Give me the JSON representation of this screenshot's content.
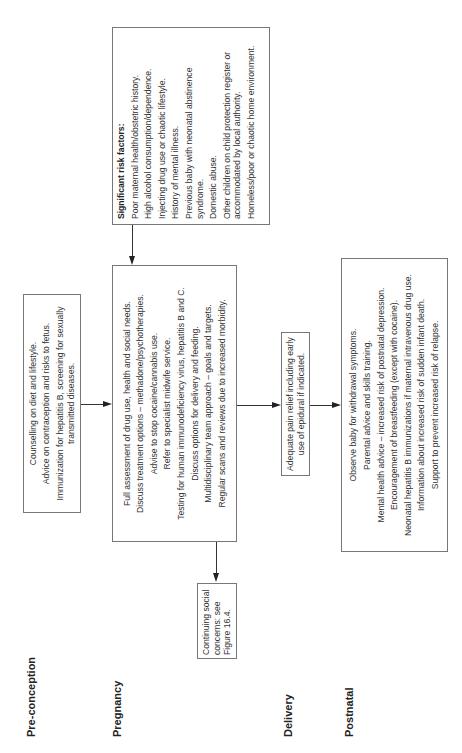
{
  "stages": {
    "preconception": "Pre-conception",
    "pregnancy": "Pregnancy",
    "delivery": "Delivery",
    "postnatal": "Postnatal"
  },
  "risk_factors": {
    "title": "Significant risk factors:",
    "items": [
      "Poor maternal health/obstetric history.",
      "High alcohol consumption/dependence.",
      "Injecting drug use or chaotic lifestyle.",
      "History of mental illness.",
      "Previous baby with neonatal abstinence syndrome.",
      "Domestic abuse.",
      "Other children on child protection register or accommodated by local authority.",
      "Homeless/poor or chaotic home environment."
    ]
  },
  "preconception_box": {
    "items": [
      "Counselling on diet and lifestyle.",
      "Advice on contraception and risks to fetus.",
      "Immunization for hepatitis B, screening for sexually transmitted diseases."
    ]
  },
  "pregnancy_box": {
    "items": [
      "Full assessment of drug use, health and social needs.",
      "Discuss treatment options – methadone/psychotherapies.",
      "Advise to stop cocaine/cannabis use.",
      "Refer to specialist midwife service.",
      "Testing for human immunodeficiency virus, hepatitis B and C.",
      "Discuss options for delivery and feeding.",
      "Multidisciplinary team approach – goals and targets.",
      "Regular scans and reviews due to increased morbidity."
    ]
  },
  "continuing_box": {
    "text": "Continuing social concerns: see Figure 16.4."
  },
  "delivery_box": {
    "text": "Adequate pain relief including early use of epidural if indicated."
  },
  "postnatal_box": {
    "items": [
      "Observe baby for withdrawal symptoms.",
      "Parental advice and skills training.",
      "Mental health advice – increased risk of postnatal depression.",
      "Encouragement of breastfeeding (except with cocaine).",
      "Neonatal hepatitis B immunizations if maternal intravenous drug use.",
      "Information about increased risk of sudden infant death.",
      "Support to prevent increased risk of relapse."
    ]
  }
}
